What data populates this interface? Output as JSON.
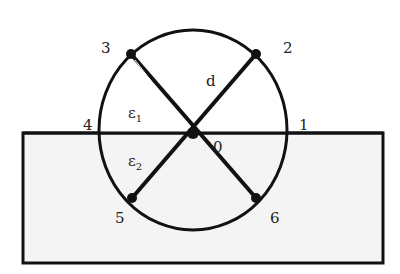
{
  "diagram": {
    "colors": {
      "stroke": "#111111",
      "fill": "#f4f4f4",
      "background": "#ffffff"
    },
    "substrate": {
      "x": 23,
      "y": 133,
      "width": 360,
      "height": 130
    },
    "circle": {
      "cx": 193,
      "cy": 133,
      "rx": 94,
      "ry": 105
    },
    "center": {
      "x": 193,
      "y": 133
    },
    "points": [
      {
        "id": "2",
        "x": 256,
        "y": 54
      },
      {
        "id": "3",
        "x": 130,
        "y": 54
      },
      {
        "id": "5",
        "x": 132,
        "y": 198
      },
      {
        "id": "6",
        "x": 256,
        "y": 198
      }
    ],
    "labels": {
      "p1": "1",
      "p2": "2",
      "p3": "3",
      "p4": "4",
      "p5": "5",
      "p6": "6",
      "p0": "0",
      "d": "d",
      "eps1": "ε",
      "eps1_sub": "1",
      "eps2": "ε",
      "eps2_sub": "2"
    }
  }
}
